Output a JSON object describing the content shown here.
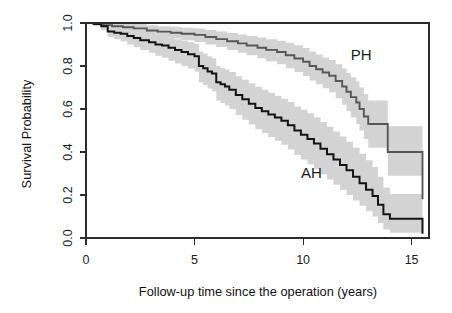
{
  "figure": {
    "kind": "kaplan-meier-survival-plot",
    "background_color": "#ffffff",
    "width": 452,
    "height": 313
  },
  "axes": {
    "x_title": "Follow-up time since the operation (years)",
    "y_title": "Survival Probability",
    "x_ticks": [
      "0",
      "5",
      "10",
      "15"
    ],
    "y_ticks": [
      "0.0",
      "0.2",
      "0.4",
      "0.6",
      "0.8",
      "1.0"
    ]
  },
  "labels": {
    "ph": "PH",
    "ah": "AH"
  },
  "colors": {
    "ph_line": "#575757",
    "ah_line": "#141414",
    "ci_band": "#d3d3d3",
    "axis": "#2b2b2b",
    "text": "#1a1a1a"
  },
  "chart_data": {
    "type": "line",
    "title": "",
    "subtitle": "",
    "xlabel": "Follow-up time since the operation (years)",
    "ylabel": "Survival Probability",
    "xlim": [
      0,
      15.8
    ],
    "ylim": [
      0.0,
      1.0
    ],
    "xticks": [
      0,
      5,
      10,
      15
    ],
    "yticks": [
      0.0,
      0.2,
      0.4,
      0.6,
      0.8,
      1.0
    ],
    "grid": false,
    "legend": "inline-annotations",
    "step_interpolation": "post",
    "annotations": [
      {
        "text": "PH",
        "x": 12.2,
        "y": 0.83
      },
      {
        "text": "AH",
        "x": 9.9,
        "y": 0.28
      }
    ],
    "series": [
      {
        "name": "PH",
        "color": "#575757",
        "x": [
          0.0,
          0.3,
          0.8,
          1.2,
          1.7,
          2.2,
          2.8,
          3.3,
          3.9,
          4.4,
          5.0,
          5.5,
          6.0,
          6.5,
          7.0,
          7.4,
          7.9,
          8.3,
          8.8,
          9.2,
          9.6,
          10.0,
          10.3,
          10.6,
          10.9,
          11.2,
          11.5,
          11.8,
          12.0,
          12.2,
          12.45,
          12.6,
          12.8,
          13.0,
          13.9,
          15.5
        ],
        "y": [
          1.0,
          1.0,
          0.99,
          0.985,
          0.98,
          0.975,
          0.965,
          0.96,
          0.955,
          0.95,
          0.945,
          0.935,
          0.925,
          0.915,
          0.905,
          0.895,
          0.885,
          0.875,
          0.865,
          0.85,
          0.835,
          0.82,
          0.8,
          0.785,
          0.77,
          0.755,
          0.73,
          0.705,
          0.68,
          0.655,
          0.63,
          0.6,
          0.565,
          0.53,
          0.4,
          0.18
        ],
        "ci_lower": [
          1.0,
          1.0,
          0.975,
          0.97,
          0.962,
          0.955,
          0.945,
          0.935,
          0.928,
          0.92,
          0.912,
          0.9,
          0.888,
          0.875,
          0.862,
          0.85,
          0.836,
          0.822,
          0.808,
          0.79,
          0.772,
          0.754,
          0.733,
          0.715,
          0.696,
          0.678,
          0.65,
          0.62,
          0.59,
          0.56,
          0.53,
          0.5,
          0.46,
          0.42,
          0.29,
          0.09
        ],
        "ci_upper": [
          1.0,
          1.0,
          1.0,
          1.0,
          0.998,
          0.995,
          0.99,
          0.985,
          0.982,
          0.978,
          0.975,
          0.968,
          0.96,
          0.953,
          0.946,
          0.94,
          0.932,
          0.925,
          0.918,
          0.908,
          0.896,
          0.884,
          0.868,
          0.854,
          0.84,
          0.828,
          0.808,
          0.788,
          0.768,
          0.748,
          0.728,
          0.7,
          0.67,
          0.64,
          0.52,
          0.3
        ]
      },
      {
        "name": "AH",
        "color": "#141414",
        "x": [
          0.0,
          0.35,
          0.7,
          1.0,
          1.3,
          1.6,
          1.9,
          2.2,
          2.5,
          2.9,
          3.2,
          3.5,
          3.8,
          4.1,
          4.4,
          4.7,
          5.0,
          5.2,
          5.4,
          5.6,
          5.8,
          6.0,
          6.2,
          6.4,
          6.6,
          6.9,
          7.2,
          7.5,
          7.8,
          8.1,
          8.4,
          8.7,
          9.0,
          9.3,
          9.6,
          9.9,
          10.2,
          10.5,
          10.8,
          11.1,
          11.4,
          11.7,
          12.0,
          12.3,
          12.6,
          12.9,
          13.2,
          13.45,
          13.7,
          14.0,
          15.5
        ],
        "y": [
          1.0,
          0.995,
          0.985,
          0.96,
          0.955,
          0.95,
          0.94,
          0.93,
          0.92,
          0.91,
          0.9,
          0.895,
          0.885,
          0.875,
          0.865,
          0.855,
          0.845,
          0.8,
          0.79,
          0.775,
          0.765,
          0.725,
          0.715,
          0.705,
          0.69,
          0.665,
          0.645,
          0.625,
          0.605,
          0.59,
          0.575,
          0.56,
          0.545,
          0.525,
          0.5,
          0.48,
          0.46,
          0.44,
          0.415,
          0.39,
          0.365,
          0.34,
          0.315,
          0.285,
          0.255,
          0.225,
          0.195,
          0.155,
          0.11,
          0.09,
          0.02
        ],
        "ci_lower": [
          1.0,
          0.985,
          0.968,
          0.935,
          0.925,
          0.915,
          0.9,
          0.888,
          0.875,
          0.862,
          0.848,
          0.838,
          0.825,
          0.812,
          0.8,
          0.788,
          0.775,
          0.725,
          0.712,
          0.695,
          0.682,
          0.64,
          0.628,
          0.616,
          0.6,
          0.572,
          0.55,
          0.528,
          0.506,
          0.488,
          0.47,
          0.452,
          0.434,
          0.412,
          0.386,
          0.365,
          0.343,
          0.321,
          0.296,
          0.272,
          0.248,
          0.224,
          0.2,
          0.175,
          0.15,
          0.125,
          0.1,
          0.07,
          0.04,
          0.025,
          0.0
        ],
        "ci_upper": [
          1.0,
          1.0,
          1.0,
          0.985,
          0.982,
          0.978,
          0.972,
          0.966,
          0.96,
          0.952,
          0.945,
          0.94,
          0.932,
          0.925,
          0.918,
          0.91,
          0.902,
          0.868,
          0.858,
          0.845,
          0.836,
          0.8,
          0.792,
          0.784,
          0.772,
          0.752,
          0.736,
          0.72,
          0.704,
          0.69,
          0.676,
          0.662,
          0.648,
          0.632,
          0.612,
          0.596,
          0.58,
          0.562,
          0.54,
          0.518,
          0.495,
          0.472,
          0.448,
          0.42,
          0.392,
          0.362,
          0.33,
          0.285,
          0.235,
          0.205,
          0.1
        ]
      }
    ]
  }
}
